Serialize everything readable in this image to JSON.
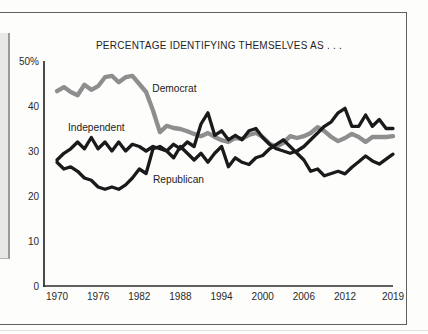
{
  "page": {
    "title": "PERCENTAGE IDENTIFYING THEMSELVES AS . . ."
  },
  "chart_data": {
    "type": "line",
    "title": "PERCENTAGE IDENTIFYING THEMSELVES AS . . .",
    "xlabel": "",
    "ylabel": "",
    "xlim": [
      1970,
      2019
    ],
    "ylim": [
      0,
      50
    ],
    "grid": false,
    "legend_position": "inline-labels",
    "axis_color": "#2b2b2b",
    "text_color": "#2a2a2a",
    "xticks": [
      "1970",
      "1976",
      "1982",
      "1988",
      "1994",
      "2000",
      "2006",
      "2012",
      "2019"
    ],
    "xtick_years": [
      1970,
      1976,
      1982,
      1988,
      1994,
      2000,
      2006,
      2012,
      2019
    ],
    "ytick_values": [
      0,
      10,
      20,
      30,
      40,
      50
    ],
    "ytick_labels": [
      "0",
      "10",
      "20",
      "30",
      "40",
      "50%"
    ],
    "x": [
      1970,
      1971,
      1972,
      1973,
      1974,
      1975,
      1976,
      1977,
      1978,
      1979,
      1980,
      1981,
      1982,
      1983,
      1984,
      1985,
      1986,
      1987,
      1988,
      1989,
      1990,
      1991,
      1992,
      1993,
      1994,
      1995,
      1996,
      1997,
      1998,
      1999,
      2000,
      2001,
      2002,
      2003,
      2004,
      2005,
      2006,
      2007,
      2008,
      2009,
      2010,
      2011,
      2012,
      2013,
      2014,
      2015,
      2016,
      2017,
      2018,
      2019
    ],
    "series": [
      {
        "name": "Democrat",
        "color": "#8e8e8e",
        "stroke_width": 4.3,
        "values": [
          43.3,
          44.2,
          43.1,
          42.4,
          44.7,
          43.6,
          44.4,
          46.4,
          46.7,
          45.3,
          46.4,
          46.7,
          44.9,
          43.1,
          39.0,
          34.2,
          35.6,
          35.1,
          34.9,
          34.4,
          33.8,
          33.3,
          34.0,
          33.1,
          32.4,
          32.0,
          32.9,
          32.7,
          33.6,
          34.0,
          33.1,
          31.6,
          30.9,
          31.8,
          33.3,
          32.9,
          33.3,
          34.0,
          35.3,
          34.4,
          33.1,
          32.2,
          32.9,
          33.8,
          33.1,
          32.0,
          33.1,
          33.1,
          33.1,
          33.3
        ]
      },
      {
        "name": "Independent",
        "color": "#1a1a1a",
        "stroke_width": 3.3,
        "values": [
          28.0,
          29.5,
          30.5,
          32.0,
          30.5,
          33.0,
          30.5,
          32.0,
          30.0,
          32.0,
          30.0,
          31.5,
          31.0,
          30.0,
          31.0,
          30.5,
          30.0,
          31.5,
          30.5,
          32.0,
          31.0,
          36.0,
          38.5,
          33.5,
          34.5,
          32.5,
          33.5,
          32.5,
          34.5,
          35.0,
          33.0,
          31.5,
          30.5,
          30.0,
          29.5,
          30.0,
          31.0,
          32.5,
          34.0,
          35.5,
          36.5,
          38.5,
          39.5,
          35.5,
          35.5,
          38.0,
          35.5,
          37.0,
          35.0,
          35.0
        ]
      },
      {
        "name": "Republican",
        "color": "#1a1a1a",
        "stroke_width": 3.3,
        "values": [
          27.5,
          26.0,
          26.5,
          25.5,
          24.0,
          23.5,
          22.0,
          21.5,
          22.0,
          21.5,
          22.5,
          24.0,
          26.0,
          25.0,
          30.5,
          31.0,
          30.0,
          28.5,
          31.0,
          29.5,
          28.0,
          29.5,
          27.5,
          29.5,
          31.0,
          26.5,
          28.5,
          27.5,
          27.0,
          28.5,
          29.0,
          30.5,
          31.5,
          32.5,
          31.0,
          29.5,
          28.0,
          25.5,
          26.0,
          24.5,
          25.0,
          25.5,
          24.9,
          26.4,
          27.6,
          28.9,
          27.8,
          27.1,
          28.2,
          29.3
        ]
      }
    ],
    "annotations": [
      {
        "text": "Democrat",
        "year": 1983.9,
        "value": 43.1
      },
      {
        "text": "Independent",
        "year": 1971.6,
        "value": 34.4
      },
      {
        "text": "Republican",
        "year": 1984.0,
        "value": 22.9
      }
    ]
  }
}
